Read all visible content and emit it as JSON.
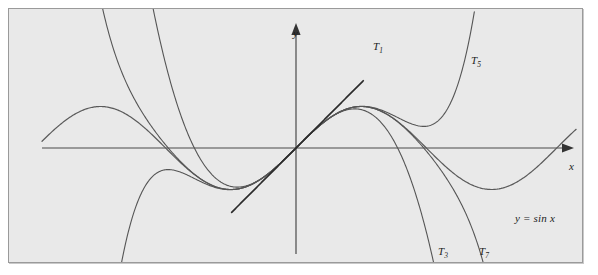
{
  "figure": {
    "name": "taylor-polynomials-of-sine",
    "background_color": "#e9e9e9",
    "frame_color": "#9a9a9a",
    "page_color": "#ffffff"
  },
  "axes": {
    "x_label": "x",
    "y_label": "y",
    "origin_px": [
      295,
      147
    ],
    "x_axis_y_px": 147,
    "y_axis_x_px": 295,
    "px_per_unit_x": 41.5,
    "px_per_unit_y": 41.5,
    "x_range_units": [
      -6.15,
      6.95
    ],
    "y_range_units": [
      -2.85,
      3.05
    ],
    "grid": false,
    "ticks": []
  },
  "labels": {
    "t1": {
      "base": "T",
      "sub": "1"
    },
    "t3": {
      "base": "T",
      "sub": "3"
    },
    "t5": {
      "base": "T",
      "sub": "5"
    },
    "t7": {
      "base": "T",
      "sub": "7"
    },
    "sine_equation": "y = sin x"
  },
  "chart_data": {
    "type": "line",
    "title": "",
    "subtitle": "",
    "xlabel": "x",
    "ylabel": "y",
    "xlim": [
      -6.15,
      6.95
    ],
    "ylim": [
      -2.85,
      3.05
    ],
    "grid": false,
    "legend": "inline-annotations",
    "annotations": [
      {
        "text": "T1",
        "x": 1.65,
        "y": 2.55
      },
      {
        "text": "T5",
        "x": 4.05,
        "y": 2.25
      },
      {
        "text": "T3",
        "x": 3.25,
        "y": -2.35
      },
      {
        "text": "T7",
        "x": 4.25,
        "y": -2.35
      },
      {
        "text": "y = sin x",
        "x": 5.1,
        "y": -1.45
      }
    ],
    "series": [
      {
        "name": "y = sin x",
        "expression": "sin(x)",
        "stroke": "#5a5a5a",
        "x_domain": [
          -6.12,
          6.75
        ],
        "key_points": [
          {
            "x": -6.12,
            "y": 0.16
          },
          {
            "x": -4.71,
            "y": 1.0
          },
          {
            "x": -3.14,
            "y": 0.0
          },
          {
            "x": -1.57,
            "y": -1.0
          },
          {
            "x": 0.0,
            "y": 0.0
          },
          {
            "x": 1.57,
            "y": 1.0
          },
          {
            "x": 3.14,
            "y": 0.0
          },
          {
            "x": 4.71,
            "y": -1.0
          },
          {
            "x": 6.28,
            "y": 0.0
          },
          {
            "x": 6.75,
            "y": 0.44
          }
        ]
      },
      {
        "name": "T1",
        "expression": "x",
        "stroke": "#2b2b2b",
        "x_domain": [
          -1.55,
          1.62
        ],
        "key_points": [
          {
            "x": -1.55,
            "y": -1.55
          },
          {
            "x": 0.0,
            "y": 0.0
          },
          {
            "x": 1.62,
            "y": 1.62
          }
        ]
      },
      {
        "name": "T3",
        "expression": "x - x^3/6",
        "stroke": "#555555",
        "x_domain": [
          -4.05,
          4.05
        ],
        "key_points": [
          {
            "x": -4.05,
            "y": 6.02
          },
          {
            "x": -2.45,
            "y": 0.0
          },
          {
            "x": -1.73,
            "y": -0.87
          },
          {
            "x": 0.0,
            "y": 0.0
          },
          {
            "x": 1.73,
            "y": 0.87
          },
          {
            "x": 2.45,
            "y": 0.0
          },
          {
            "x": 4.05,
            "y": -6.02
          }
        ]
      },
      {
        "name": "T5",
        "expression": "x - x^3/6 + x^5/120",
        "stroke": "#555555",
        "x_domain": [
          -5.45,
          5.45
        ],
        "key_points": [
          {
            "x": -5.45,
            "y": -2.83
          },
          {
            "x": -4.55,
            "y": 1.6
          },
          {
            "x": -3.2,
            "y": 0.12
          },
          {
            "x": -1.59,
            "y": -1.0
          },
          {
            "x": 0.0,
            "y": 0.0
          },
          {
            "x": 1.59,
            "y": 1.0
          },
          {
            "x": 3.2,
            "y": -0.12
          },
          {
            "x": 4.55,
            "y": -1.6
          },
          {
            "x": 5.45,
            "y": 2.83
          }
        ]
      },
      {
        "name": "T7",
        "expression": "x - x^3/6 + x^5/120 - x^7/5040",
        "stroke": "#555555",
        "x_domain": [
          -4.85,
          4.85
        ],
        "key_points": [
          {
            "x": -4.85,
            "y": 3.35
          },
          {
            "x": -4.2,
            "y": 0.79
          },
          {
            "x": -3.14,
            "y": 0.01
          },
          {
            "x": -1.57,
            "y": -1.0
          },
          {
            "x": 0.0,
            "y": 0.0
          },
          {
            "x": 1.57,
            "y": 1.0
          },
          {
            "x": 3.14,
            "y": -0.01
          },
          {
            "x": 4.2,
            "y": -0.79
          },
          {
            "x": 4.85,
            "y": -3.35
          }
        ]
      }
    ]
  }
}
